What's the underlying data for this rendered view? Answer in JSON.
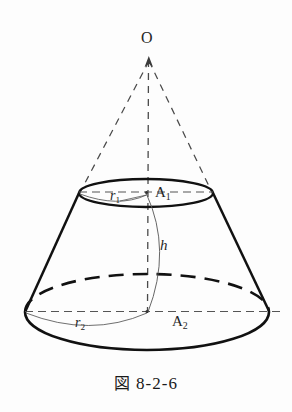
{
  "figure": {
    "caption_symbol": "図",
    "caption_number": "8-2-6",
    "caption_full": "図 8-2-6",
    "background_color": "#fdfdfd",
    "stroke_color": "#111111",
    "thin_stroke_color": "#555555",
    "dash_stroke_color": "#444444"
  },
  "labels": {
    "apex": "O",
    "top_radius": {
      "symbol": "r",
      "subscript": "1"
    },
    "top_center": {
      "symbol": "A",
      "subscript": "1"
    },
    "height": {
      "symbol": "h",
      "subscript": ""
    },
    "bottom_radius": {
      "symbol": "r",
      "subscript": "2"
    },
    "bottom_center": {
      "symbol": "A",
      "subscript": "2"
    }
  },
  "geometry": {
    "apex_point": {
      "x": 149,
      "y": 58
    },
    "top_ellipse": {
      "cx": 146,
      "cy": 193,
      "rx": 67,
      "ry": 14
    },
    "bottom_ellipse": {
      "cx": 147,
      "cy": 312,
      "rx": 122,
      "ry": 38
    },
    "axis_top": {
      "x": 149,
      "y": 58
    },
    "axis_bottom": {
      "x": 147,
      "y": 312
    }
  }
}
